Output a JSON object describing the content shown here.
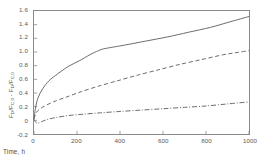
{
  "chart_data": {
    "type": "line",
    "title": "",
    "xlabel": "Time, h",
    "ylabel_parts": {
      "num1": "F",
      "sub1": "D",
      "mid": "/F",
      "sub2": "C,0",
      "minus": " - ",
      "num2": "F",
      "sub3": "D",
      "mid2": "/F",
      "sub4": "C,0"
    },
    "ylabel_plain": "F_D/F_C,0 - F_D/F_C,0",
    "xlim": [
      0,
      1000
    ],
    "ylim": [
      -0.2,
      1.6
    ],
    "xticks": [
      0,
      200,
      400,
      600,
      800,
      1000
    ],
    "xtick_labels": [
      "0",
      "200",
      "400",
      "600",
      "800",
      "1000"
    ],
    "yticks": [
      -0.2,
      0,
      0.2,
      0.4,
      0.6,
      0.8,
      1.0,
      1.2,
      1.4,
      1.6
    ],
    "ytick_labels": [
      "-0.2",
      "0",
      "0.2",
      "0.4",
      "0.6",
      "0.8",
      "1.0",
      "1.2",
      "1.4",
      "1.6"
    ],
    "grid": false,
    "legend": "none",
    "line_color": "#5a5a5c",
    "frame_color": "#8a8a8a",
    "series": [
      {
        "name": "solid-curve",
        "style": "solid",
        "dasharray": "",
        "x": [
          0,
          8,
          20,
          40,
          70,
          110,
          160,
          210,
          260,
          300,
          330,
          420,
          520,
          620,
          720,
          820,
          910,
          1000
        ],
        "y": [
          0.02,
          0.2,
          0.34,
          0.46,
          0.58,
          0.68,
          0.79,
          0.87,
          0.96,
          1.02,
          1.05,
          1.1,
          1.16,
          1.22,
          1.29,
          1.36,
          1.44,
          1.52
        ]
      },
      {
        "name": "dashed-curve",
        "style": "dashed",
        "dasharray": "4.2,2.6",
        "x": [
          0,
          10,
          25,
          50,
          90,
          150,
          220,
          300,
          390,
          480,
          580,
          680,
          780,
          880,
          940,
          1000
        ],
        "y": [
          0.02,
          0.11,
          0.16,
          0.21,
          0.27,
          0.34,
          0.42,
          0.5,
          0.58,
          0.66,
          0.74,
          0.82,
          0.89,
          0.96,
          0.99,
          1.02
        ]
      },
      {
        "name": "dash-dot-curve",
        "style": "dashdot",
        "dasharray": "5,1.8,1,1.8",
        "x": [
          0,
          8,
          18,
          35,
          60,
          100,
          160,
          230,
          310,
          400,
          500,
          600,
          700,
          800,
          900,
          1000
        ],
        "y": [
          0.02,
          -0.03,
          -0.04,
          -0.02,
          0.01,
          0.04,
          0.07,
          0.09,
          0.11,
          0.13,
          0.15,
          0.17,
          0.19,
          0.21,
          0.24,
          0.27
        ]
      }
    ]
  }
}
